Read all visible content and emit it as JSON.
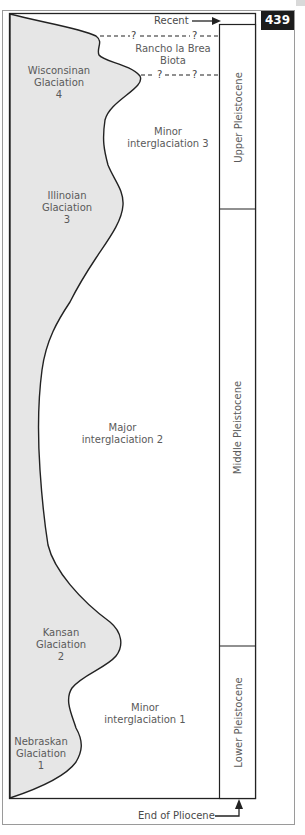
{
  "page": {
    "number": "439"
  },
  "markers": {
    "top": "Recent",
    "bottom": "End of Pliocene"
  },
  "biota": {
    "line1": "Rancho la Brea",
    "line2": "Biota",
    "uncertain_mark": "?"
  },
  "periods": [
    {
      "label": "Upper Pleistocene"
    },
    {
      "label": "Middle Pleistocene"
    },
    {
      "label": "Lower Pleistocene"
    }
  ],
  "glaciations": [
    {
      "name": "Wisconsinan",
      "line2": "Glaciation",
      "number": "4"
    },
    {
      "name": "Illinoian",
      "line2": "Glaciation",
      "number": "3"
    },
    {
      "name": "Kansan",
      "line2": "Glaciation",
      "number": "2"
    },
    {
      "name": "Nebraskan",
      "line2": "Glaciation",
      "number": "1"
    }
  ],
  "interglaciations": [
    {
      "line1": "Minor",
      "line2": "interglaciation 3"
    },
    {
      "line1": "Major",
      "line2": "interglaciation 2"
    },
    {
      "line1": "Minor",
      "line2": "interglaciation 1"
    }
  ],
  "colors": {
    "glacial_fill": "#e6e6e6",
    "line": "#222222",
    "badge": "#1c1c1c"
  }
}
